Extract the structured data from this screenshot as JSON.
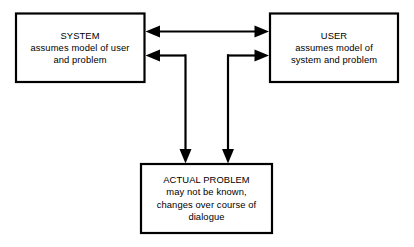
{
  "diagram": {
    "background_color": "#ffffff",
    "line_color": "#000000",
    "text_color": "#000000",
    "nodes": [
      {
        "id": "system",
        "title": "SYSTEM",
        "lines": [
          "assumes model of user",
          "and problem"
        ]
      },
      {
        "id": "user",
        "title": "USER",
        "lines": [
          "assumes model of",
          "system and problem"
        ]
      },
      {
        "id": "problem",
        "title": "ACTUAL PROBLEM",
        "lines": [
          "may not be known,",
          "changes over course of",
          "dialogue"
        ]
      }
    ],
    "connectors": [
      {
        "id": "system-user-bidirectional",
        "from": "system",
        "to": "user",
        "arrowheads": "both"
      },
      {
        "id": "problem-to-system",
        "from": "problem",
        "to": "system",
        "arrowheads": "both"
      },
      {
        "id": "problem-to-user",
        "from": "problem",
        "to": "user",
        "arrowheads": "both"
      }
    ]
  }
}
